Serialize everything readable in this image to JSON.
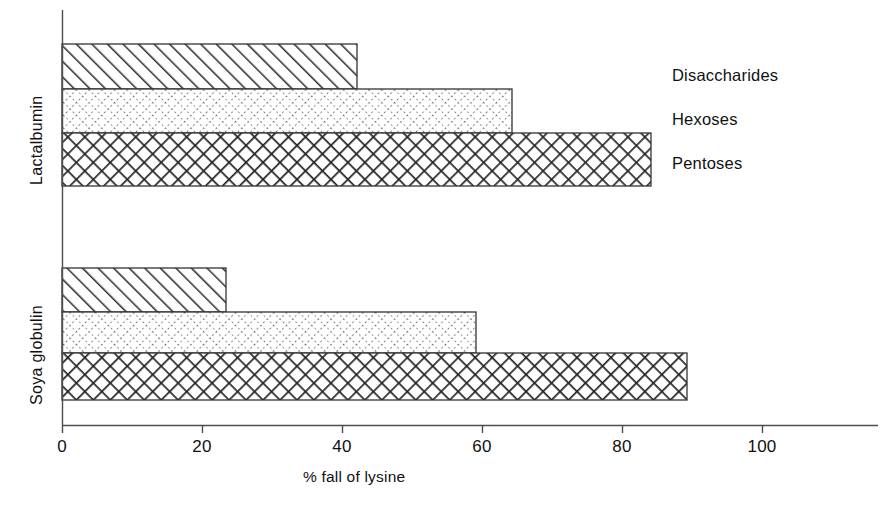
{
  "chart_data": {
    "type": "bar",
    "orientation": "horizontal",
    "title": "",
    "xlabel": "% fall of lysine",
    "ylabel": "",
    "xlim": [
      0,
      116
    ],
    "xticks": [
      0,
      20,
      40,
      60,
      80,
      100
    ],
    "xtick_labels": [
      "0",
      "20",
      "40",
      "60",
      "80",
      "100"
    ],
    "grid": false,
    "legend_position": "right",
    "categories": [
      "Lactalbumin",
      "Soya globulin"
    ],
    "series": [
      {
        "name": "Disaccharides",
        "pattern": "diagonal-hatch",
        "values": [
          42.1,
          23.4
        ]
      },
      {
        "name": "Hexoses",
        "pattern": "dotted-crosshatch",
        "values": [
          64.3,
          59.1
        ]
      },
      {
        "name": "Pentoses",
        "pattern": "dense-crosshatch",
        "values": [
          84.1,
          89.3
        ]
      }
    ]
  },
  "axis": {
    "x_title": "% fall of lysine",
    "ticks": [
      {
        "label": "0",
        "value": 0
      },
      {
        "label": "20",
        "value": 20
      },
      {
        "label": "40",
        "value": 40
      },
      {
        "label": "60",
        "value": 60
      },
      {
        "label": "80",
        "value": 80
      },
      {
        "label": "100",
        "value": 100
      }
    ]
  },
  "groups": [
    {
      "label": "Lactalbumin"
    },
    {
      "label": "Soya globulin"
    }
  ],
  "legend": {
    "items": [
      {
        "label": "Disaccharides",
        "pattern": "diagonal-hatch"
      },
      {
        "label": "Hexoses",
        "pattern": "dotted-crosshatch"
      },
      {
        "label": "Pentoses",
        "pattern": "dense-crosshatch"
      }
    ]
  },
  "colors": {
    "ink": "#111111",
    "axis": "#555555",
    "background": "#ffffff"
  }
}
